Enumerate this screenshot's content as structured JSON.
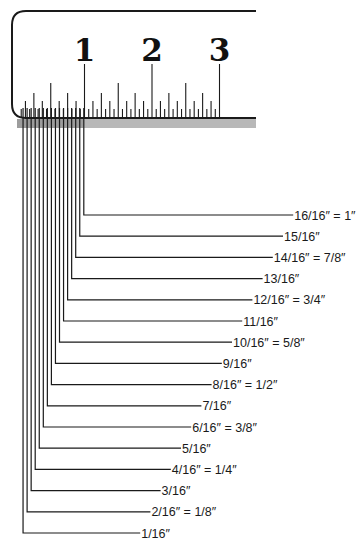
{
  "diagram": {
    "title": "Ruler inch subdivisions in sixteenths",
    "ruler": {
      "numbers": [
        "1",
        "2",
        "3"
      ],
      "zero_x": 17,
      "inch_px": 67.5,
      "colors": {
        "ink": "#1a1a1a",
        "shade": "#b8b8b8"
      }
    },
    "labels": [
      {
        "sixteenths": 16,
        "text": "16/16″ = 1″"
      },
      {
        "sixteenths": 15,
        "text": "15/16″"
      },
      {
        "sixteenths": 14,
        "text": "14/16″ = 7/8″"
      },
      {
        "sixteenths": 13,
        "text": "13/16″"
      },
      {
        "sixteenths": 12,
        "text": "12/16″ = 3/4″"
      },
      {
        "sixteenths": 11,
        "text": "11/16″"
      },
      {
        "sixteenths": 10,
        "text": "10/16″ = 5/8″"
      },
      {
        "sixteenths": 9,
        "text": "9/16″"
      },
      {
        "sixteenths": 8,
        "text": "8/16″ = 1/2″"
      },
      {
        "sixteenths": 7,
        "text": "7/16″"
      },
      {
        "sixteenths": 6,
        "text": "6/16″ = 3/8″"
      },
      {
        "sixteenths": 5,
        "text": "5/16″"
      },
      {
        "sixteenths": 4,
        "text": "4/16″ = 1/4″"
      },
      {
        "sixteenths": 3,
        "text": "3/16″"
      },
      {
        "sixteenths": 2,
        "text": "2/16″ = 1/8″"
      },
      {
        "sixteenths": 1,
        "text": "1/16″"
      }
    ]
  }
}
